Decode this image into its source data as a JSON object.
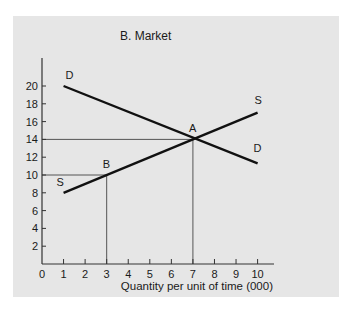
{
  "chart_data": {
    "type": "line",
    "title": "B. Market",
    "xlabel": "Quantity per unit of time (000)",
    "ylabel": "",
    "xlim": [
      0,
      10.8
    ],
    "ylim": [
      0,
      22
    ],
    "x_ticks": [
      0,
      1,
      2,
      3,
      4,
      5,
      6,
      7,
      8,
      9,
      10
    ],
    "y_ticks": [
      2,
      4,
      6,
      8,
      10,
      12,
      14,
      16,
      18,
      20
    ],
    "grid": false,
    "series": [
      {
        "name": "D",
        "label_start": "D",
        "label_end": "D",
        "points": [
          [
            1,
            20
          ],
          [
            10,
            11.3
          ]
        ]
      },
      {
        "name": "S",
        "label_start": "S",
        "label_end": "S",
        "points": [
          [
            1,
            8
          ],
          [
            10,
            17
          ]
        ]
      }
    ],
    "annotations": [
      {
        "label": "A",
        "x": 7,
        "y": 14,
        "guides": true
      },
      {
        "label": "B",
        "x": 3,
        "y": 10,
        "guides": true
      }
    ]
  }
}
